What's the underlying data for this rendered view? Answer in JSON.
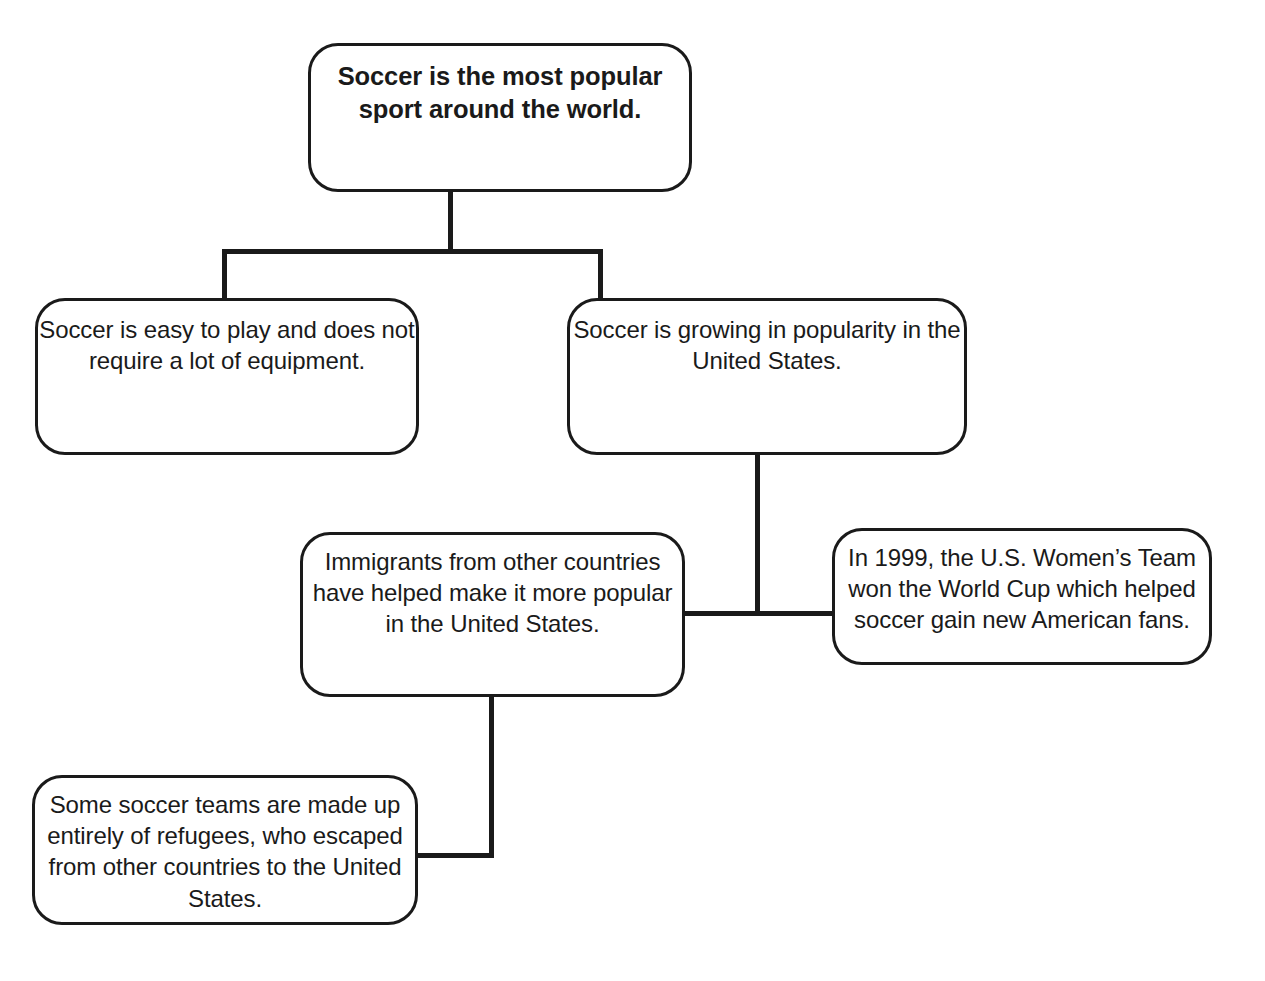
{
  "diagram": {
    "type": "hierarchy-tree-idea-web",
    "title": "Soccer is the most popular sport around the world.",
    "line_color": "#1a1a1a",
    "box_fill": "#ffffff",
    "nodes": [
      {
        "id": "root",
        "text": "Soccer is the most popular sport around the world.",
        "emphasis": "bold",
        "level": 0
      },
      {
        "id": "easy",
        "text": "Soccer is easy to play and does not require a lot of equipment.",
        "emphasis": "normal",
        "level": 1
      },
      {
        "id": "growing",
        "text": "Soccer is growing in popularity in the United States.",
        "emphasis": "normal",
        "level": 1
      },
      {
        "id": "immigrants",
        "text": "Immigrants from other countries have helped make it more popular in the United States.",
        "emphasis": "normal",
        "level": 2
      },
      {
        "id": "worldcup",
        "text": "In 1999, the U.S. Women’s Team won the World Cup which helped soccer gain new American fans.",
        "emphasis": "normal",
        "level": 2
      },
      {
        "id": "refugees",
        "text": "Some soccer teams are made up entirely of refugees, who escaped from other countries to the United States.",
        "emphasis": "normal",
        "level": 3
      }
    ],
    "edges": [
      {
        "from": "root",
        "to": "easy"
      },
      {
        "from": "root",
        "to": "growing"
      },
      {
        "from": "growing",
        "to": "immigrants"
      },
      {
        "from": "growing",
        "to": "worldcup"
      },
      {
        "from": "immigrants",
        "to": "refugees"
      }
    ]
  }
}
